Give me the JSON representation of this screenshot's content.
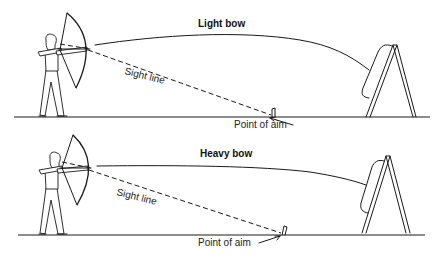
{
  "diagram": {
    "panels": [
      {
        "id": "light",
        "title": "Light bow",
        "sight_line_label": "Sight line",
        "aim_label": "Point of aim",
        "trajectory": "high arc",
        "point_of_aim_position": "close to target"
      },
      {
        "id": "heavy",
        "title": "Heavy bow",
        "sight_line_label": "Sight line",
        "aim_label": "Point of aim",
        "trajectory": "flatter arc",
        "point_of_aim_position": "farther in front of target"
      }
    ],
    "colors": {
      "ink": "#1a1a1a",
      "background": "#ffffff"
    }
  }
}
